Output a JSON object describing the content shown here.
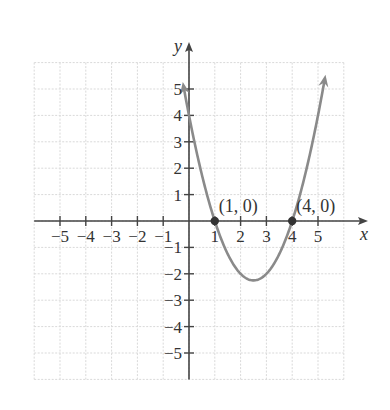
{
  "chart_data": {
    "type": "line",
    "title": "",
    "function": "y = x^2 - 5x + 4",
    "xlabel": "x",
    "ylabel": "y",
    "xlim": [
      -6,
      6
    ],
    "ylim": [
      -6,
      6
    ],
    "grid": true,
    "x_ticks": [
      -5,
      -4,
      -3,
      -2,
      -1,
      1,
      2,
      3,
      4,
      5
    ],
    "y_ticks": [
      -5,
      -4,
      -3,
      -2,
      -1,
      1,
      2,
      3,
      4,
      5
    ],
    "x_tick_labels": [
      "−5",
      "−4",
      "−3",
      "−2",
      "−1",
      "1",
      "2",
      "3",
      "4",
      "5"
    ],
    "y_tick_labels": [
      "−5",
      "−4",
      "−3",
      "−2",
      "−1",
      "1",
      "2",
      "3",
      "4",
      "5"
    ],
    "series": [
      {
        "name": "parabola",
        "x_range": [
          -0.25,
          5.25
        ],
        "vertex": [
          2.5,
          -2.25
        ],
        "y_intercept": [
          0,
          4
        ],
        "arrows_both_ends": true
      }
    ],
    "points": [
      {
        "x": 1,
        "y": 0,
        "label": "(1, 0)"
      },
      {
        "x": 4,
        "y": 0,
        "label": "(4, 0)"
      }
    ]
  },
  "colors": {
    "curve": "#8a8a8a",
    "axis": "#444444",
    "grid": "#d9d9d9",
    "point": "#333333",
    "text": "#333333"
  },
  "layout": {
    "origin_px": [
      189,
      221
    ],
    "unit_x_px": 25.8,
    "unit_y_px": 26.4
  }
}
